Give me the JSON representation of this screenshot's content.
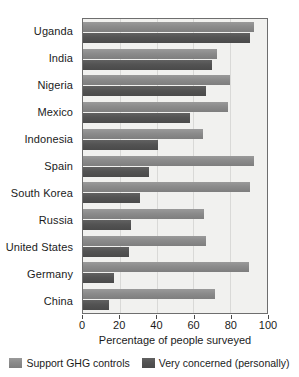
{
  "chart_data": {
    "type": "bar",
    "orientation": "horizontal",
    "title": "",
    "xlabel": "Percentage of people surveyed",
    "ylabel": "",
    "xlim": [
      0,
      100
    ],
    "xticks": [
      0,
      20,
      40,
      60,
      80,
      100
    ],
    "grid": true,
    "legend_position": "bottom",
    "categories": [
      "Uganda",
      "India",
      "Nigeria",
      "Mexico",
      "Indonesia",
      "Spain",
      "South Korea",
      "Russia",
      "United States",
      "Germany",
      "China"
    ],
    "series": [
      {
        "name": "Support GHG controls",
        "color": "#8b8b8b",
        "values": [
          93,
          73,
          80,
          79,
          65,
          93,
          91,
          66,
          67,
          90,
          72
        ]
      },
      {
        "name": "Very concerned (personally)",
        "color": "#535353",
        "values": [
          91,
          70,
          67,
          58,
          41,
          36,
          31,
          26,
          25,
          17,
          14
        ]
      }
    ]
  },
  "axis": {
    "x_title": "Percentage of people surveyed",
    "tick_labels": [
      "0",
      "20",
      "40",
      "60",
      "80",
      "100"
    ]
  },
  "legend": {
    "items": [
      {
        "label": "Support GHG controls",
        "swatch": "light-gray-swatch"
      },
      {
        "label": "Very concerned (personally)",
        "swatch": "dark-gray-swatch"
      }
    ]
  }
}
